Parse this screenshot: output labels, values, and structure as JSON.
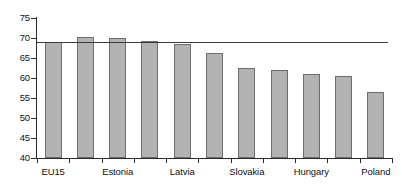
{
  "chart_data": {
    "type": "bar",
    "title": "",
    "subtitle": "",
    "xlabel": "",
    "ylabel": "",
    "ylim": [
      40,
      75
    ],
    "ytick_step": 5,
    "yticks": [
      40,
      45,
      50,
      55,
      60,
      65,
      70,
      75
    ],
    "ytick_labels": [
      "40",
      "45",
      "50",
      "55",
      "60",
      "65",
      "70",
      "75"
    ],
    "grid": false,
    "legend": "none",
    "bar_color": "#b3b3b3",
    "bar_edge_color": "#6e6e6e",
    "axis_color": "#2b2b2b",
    "reference_line": {
      "value": 69.0,
      "color": "#3a3a3a",
      "orientation": "horizontal"
    },
    "categories": [
      "EU15",
      "",
      "Estonia",
      "",
      "Latvia",
      "",
      "Slovakia",
      "",
      "Hungary",
      "",
      "Poland"
    ],
    "tick_labels_visible": [
      "EU15",
      "Estonia",
      "Latvia",
      "Slovakia",
      "Hungary",
      "Poland"
    ],
    "values": [
      69.0,
      70.3,
      70.1,
      69.2,
      68.5,
      66.2,
      62.4,
      62.1,
      61.0,
      60.6,
      56.5
    ]
  }
}
